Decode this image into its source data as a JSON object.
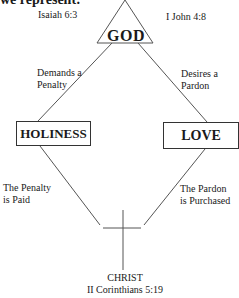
{
  "header_text": "we represent:",
  "top": {
    "left_reference": "Isaiah 6:3",
    "right_reference": "I John 4:8",
    "apex_label": "GOD"
  },
  "upper_edges": {
    "left_label_line1": "Demands a",
    "left_label_line2": "Penalty",
    "right_label_line1": "Desires a",
    "right_label_line2": "Pardon"
  },
  "nodes": {
    "left": "HOLINESS",
    "right": "LOVE"
  },
  "lower_edges": {
    "left_label_line1": "The Penalty",
    "left_label_line2": "is Paid",
    "right_label_line1": "The Pardon",
    "right_label_line2": "is Purchased"
  },
  "bottom": {
    "title": "CHRIST",
    "reference": "II Corinthians 5:19",
    "symbol": "cross-icon"
  },
  "colors": {
    "line": "#555555",
    "text": "#1a1a1a",
    "background": "#ffffff"
  }
}
